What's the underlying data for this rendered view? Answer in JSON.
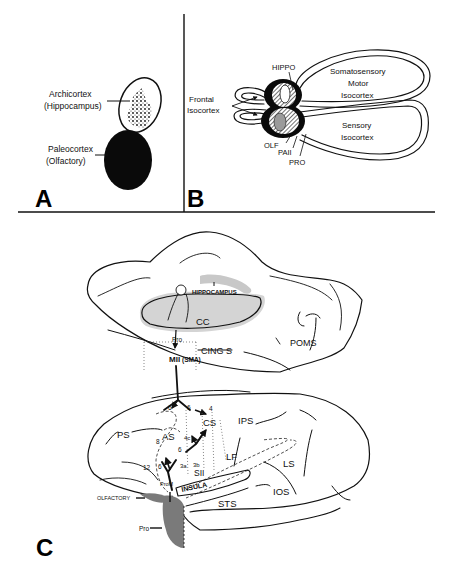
{
  "figure": {
    "panels": [
      {
        "id": "A",
        "letter": "A",
        "labels": {
          "archicortex_line1": "Archicortex",
          "archicortex_line2": "(Hippocampus)",
          "paleocortex_line1": "Paleocortex",
          "paleocortex_line2": "(Olfactory)"
        }
      },
      {
        "id": "B",
        "letter": "B",
        "labels": {
          "hippo": "HIPPO",
          "somatosensory_line1": "Somatosensory",
          "somatosensory_line2": "Motor",
          "somatosensory_line3": "Isocortex",
          "frontal_line1": "Frontal",
          "frontal_line2": "Isocortex",
          "sensory_line1": "Sensory",
          "sensory_line2": "Isocortex",
          "olf": "OLF",
          "pa2": "PAII",
          "pro": "PRO"
        }
      },
      {
        "id": "C",
        "letter": "C",
        "medial_labels": {
          "hippocampus": "HIPPOCAMPUS",
          "cc": "CC",
          "pro": "Pro",
          "cing_s": "CING S",
          "m2": "MII",
          "sma": "(SMA)",
          "poms": "POMS"
        },
        "lateral_labels": {
          "ps": "PS",
          "as": "AS",
          "cs": "CS",
          "ips": "IPS",
          "lf": "LF",
          "ls": "LS",
          "ios": "IOS",
          "sts": "STS",
          "insula": "INSULA",
          "s2": "SII",
          "olfactory": "OLFACTORY",
          "pro": "Pro",
          "proM": "ProM",
          "area_6a": "6",
          "area_6b": "6",
          "area_4": "4",
          "area_4c": "4c",
          "area_6c": "6",
          "area_6d": "6",
          "area_6e": "6",
          "area_8": "8",
          "area_12": "12",
          "area_3a": "3a",
          "area_3b": "3b"
        }
      }
    ],
    "colors": {
      "ink": "#111111",
      "gray_fill": "#7a7a7a",
      "light_gray": "#c8c8c8",
      "background": "#ffffff"
    }
  }
}
